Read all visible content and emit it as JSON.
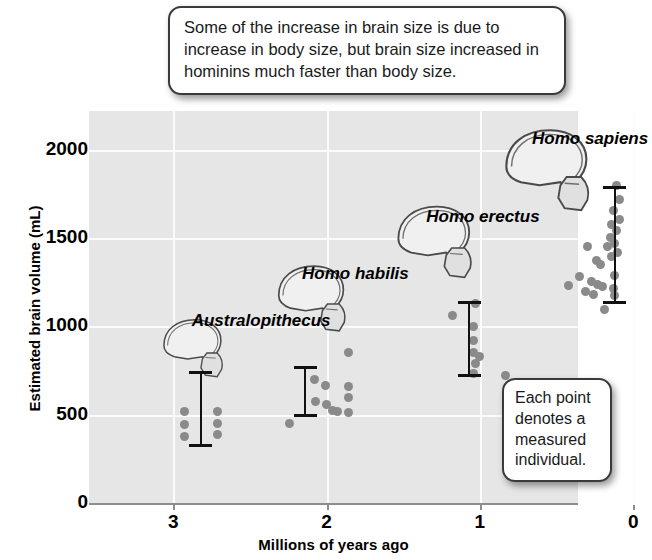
{
  "figure": {
    "callout_top": "Some of the increase in brain size is due to increase in body size, but brain size increased in hominins much faster than body size.",
    "callout_point": "Each point denotes a measured individual."
  },
  "chart_data": {
    "type": "scatter",
    "title": "",
    "xlabel": "Millions of years ago",
    "ylabel": "Estimated brain volume (mL)",
    "xlim": [
      3.55,
      0.36
    ],
    "ylim": [
      0,
      2220
    ],
    "x_ticks": [
      3,
      2,
      1,
      0
    ],
    "x_tick_labels": [
      "3",
      "2",
      "1",
      "0"
    ],
    "y_ticks": [
      0,
      500,
      1000,
      1500,
      2000
    ],
    "y_tick_labels": [
      "0",
      "500",
      "1000",
      "1500",
      "2000"
    ],
    "grid": true,
    "legend": "none",
    "x_axis_reversed": true,
    "point_color": "#8a8a8a",
    "plot_background": "#e6e6e6",
    "gridline_color": "#fbfbfb",
    "errorbar_color": "#111111",
    "series": [
      {
        "name": "Australopithecus",
        "label_x": 2.88,
        "label_y": 1030,
        "errorbar": {
          "x": 2.82,
          "low": 330,
          "high": 740
        },
        "points": [
          {
            "x": 2.93,
            "y": 520
          },
          {
            "x": 2.93,
            "y": 445
          },
          {
            "x": 2.93,
            "y": 375
          },
          {
            "x": 2.71,
            "y": 520
          },
          {
            "x": 2.71,
            "y": 450
          },
          {
            "x": 2.71,
            "y": 390
          }
        ]
      },
      {
        "name": "Homo habilis",
        "label_x": 2.16,
        "label_y": 1295,
        "errorbar": {
          "x": 2.14,
          "low": 500,
          "high": 770
        },
        "points": [
          {
            "x": 2.24,
            "y": 450
          },
          {
            "x": 2.08,
            "y": 700
          },
          {
            "x": 2.01,
            "y": 665
          },
          {
            "x": 2.07,
            "y": 575
          },
          {
            "x": 2.0,
            "y": 560
          },
          {
            "x": 1.96,
            "y": 525
          },
          {
            "x": 1.93,
            "y": 520
          },
          {
            "x": 1.86,
            "y": 850
          },
          {
            "x": 1.86,
            "y": 660
          },
          {
            "x": 1.86,
            "y": 600
          },
          {
            "x": 1.86,
            "y": 515
          }
        ]
      },
      {
        "name": "Homo erectus",
        "label_x": 1.35,
        "label_y": 1620,
        "errorbar": {
          "x": 1.07,
          "low": 725,
          "high": 1140
        },
        "points": [
          {
            "x": 1.18,
            "y": 1060
          },
          {
            "x": 1.03,
            "y": 1130
          },
          {
            "x": 1.04,
            "y": 1000
          },
          {
            "x": 1.04,
            "y": 920
          },
          {
            "x": 1.04,
            "y": 855
          },
          {
            "x": 1.0,
            "y": 830
          },
          {
            "x": 1.03,
            "y": 790
          },
          {
            "x": 1.04,
            "y": 735
          },
          {
            "x": 0.83,
            "y": 720
          }
        ]
      },
      {
        "name": "Homo sapiens",
        "label_x": 0.66,
        "label_y": 2060,
        "errorbar": {
          "x": 0.12,
          "low": 1140,
          "high": 1790
        },
        "points": [
          {
            "x": 0.11,
            "y": 1800
          },
          {
            "x": 0.09,
            "y": 1720
          },
          {
            "x": 0.13,
            "y": 1655
          },
          {
            "x": 0.09,
            "y": 1605
          },
          {
            "x": 0.14,
            "y": 1575
          },
          {
            "x": 0.11,
            "y": 1545
          },
          {
            "x": 0.15,
            "y": 1505
          },
          {
            "x": 0.12,
            "y": 1470
          },
          {
            "x": 0.17,
            "y": 1450
          },
          {
            "x": 0.1,
            "y": 1420
          },
          {
            "x": 0.14,
            "y": 1395
          },
          {
            "x": 0.12,
            "y": 1290
          },
          {
            "x": 0.13,
            "y": 1215
          },
          {
            "x": 0.12,
            "y": 1175
          },
          {
            "x": 0.3,
            "y": 1450
          },
          {
            "x": 0.24,
            "y": 1375
          },
          {
            "x": 0.21,
            "y": 1350
          },
          {
            "x": 0.35,
            "y": 1280
          },
          {
            "x": 0.27,
            "y": 1255
          },
          {
            "x": 0.23,
            "y": 1240
          },
          {
            "x": 0.2,
            "y": 1225
          },
          {
            "x": 0.31,
            "y": 1195
          },
          {
            "x": 0.26,
            "y": 1180
          },
          {
            "x": 0.42,
            "y": 1230
          },
          {
            "x": 0.19,
            "y": 1095
          }
        ]
      }
    ],
    "skulls": [
      {
        "species": "Australopithecus",
        "x": 2.86,
        "y": 880,
        "size": 74
      },
      {
        "species": "Homo habilis",
        "x": 2.08,
        "y": 1160,
        "size": 84
      },
      {
        "species": "Homo erectus",
        "x": 1.28,
        "y": 1480,
        "size": 92
      },
      {
        "species": "Homo sapiens",
        "x": 0.54,
        "y": 1890,
        "size": 104
      }
    ]
  }
}
